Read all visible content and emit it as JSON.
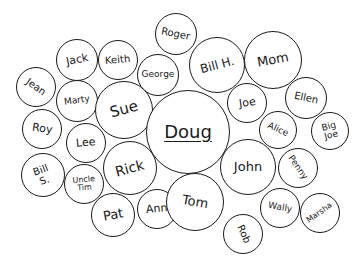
{
  "diagram": {
    "type": "name-bubble-cluster",
    "colors": {
      "ink": "#1a1a1a",
      "background": "#ffffff"
    },
    "bubbles": [
      {
        "name": "Roger",
        "x": 176,
        "y": 34,
        "r": 21,
        "size": 10,
        "rot": 12
      },
      {
        "name": "Jack",
        "x": 77,
        "y": 60,
        "r": 21,
        "size": 11,
        "rot": -12
      },
      {
        "name": "Keith",
        "x": 118,
        "y": 60,
        "r": 20,
        "size": 10,
        "rot": -5
      },
      {
        "name": "George",
        "x": 158,
        "y": 75,
        "r": 21,
        "size": 9,
        "rot": 0
      },
      {
        "name": "Bill H.",
        "x": 217,
        "y": 65,
        "r": 28,
        "size": 12,
        "rot": -15
      },
      {
        "name": "Mom",
        "x": 273,
        "y": 60,
        "r": 29,
        "size": 13,
        "rot": -10
      },
      {
        "name": "Jean",
        "x": 36,
        "y": 87,
        "r": 20,
        "size": 10,
        "rot": 35
      },
      {
        "name": "Marty",
        "x": 77,
        "y": 101,
        "r": 21,
        "size": 9,
        "rot": -8
      },
      {
        "name": "Sue",
        "x": 124,
        "y": 110,
        "r": 29,
        "size": 15,
        "rot": -15
      },
      {
        "name": "Doug",
        "x": 188,
        "y": 132,
        "r": 42,
        "size": 18,
        "rot": 0
      },
      {
        "name": "Joe",
        "x": 247,
        "y": 103,
        "r": 20,
        "size": 11,
        "rot": -8
      },
      {
        "name": "Ellen",
        "x": 306,
        "y": 98,
        "r": 21,
        "size": 10,
        "rot": 12
      },
      {
        "name": "Alice",
        "x": 278,
        "y": 130,
        "r": 19,
        "size": 9,
        "rot": 25
      },
      {
        "name": "Big\nJoe",
        "x": 330,
        "y": 131,
        "r": 19,
        "size": 9,
        "rot": -15
      },
      {
        "name": "Roy",
        "x": 42,
        "y": 129,
        "r": 20,
        "size": 11,
        "rot": 8
      },
      {
        "name": "Lee",
        "x": 86,
        "y": 143,
        "r": 20,
        "size": 11,
        "rot": -5
      },
      {
        "name": "Bill\nS.",
        "x": 43,
        "y": 175,
        "r": 22,
        "size": 10,
        "rot": -20
      },
      {
        "name": "Uncle\nTim",
        "x": 84,
        "y": 184,
        "r": 20,
        "size": 8,
        "rot": -5
      },
      {
        "name": "Rick",
        "x": 130,
        "y": 168,
        "r": 27,
        "size": 14,
        "rot": -15
      },
      {
        "name": "John",
        "x": 248,
        "y": 167,
        "r": 28,
        "size": 13,
        "rot": 0
      },
      {
        "name": "Penny",
        "x": 298,
        "y": 168,
        "r": 20,
        "size": 9,
        "rot": 55
      },
      {
        "name": "Pat",
        "x": 113,
        "y": 215,
        "r": 22,
        "size": 13,
        "rot": -10
      },
      {
        "name": "Ann",
        "x": 157,
        "y": 209,
        "r": 20,
        "size": 11,
        "rot": -5
      },
      {
        "name": "Tom",
        "x": 195,
        "y": 202,
        "r": 29,
        "size": 13,
        "rot": 10
      },
      {
        "name": "Wally",
        "x": 280,
        "y": 208,
        "r": 20,
        "size": 9,
        "rot": 10
      },
      {
        "name": "Marsha",
        "x": 320,
        "y": 213,
        "r": 20,
        "size": 8,
        "rot": -35
      },
      {
        "name": "Rob",
        "x": 243,
        "y": 234,
        "r": 20,
        "size": 10,
        "rot": 65
      }
    ]
  }
}
